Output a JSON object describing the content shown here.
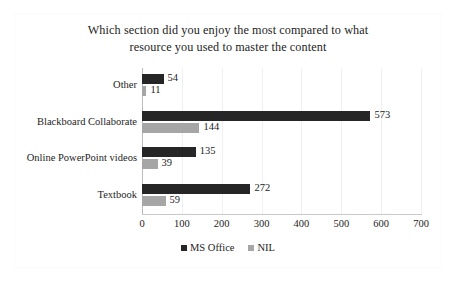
{
  "chart_data": {
    "type": "bar",
    "orientation": "horizontal",
    "title": "Which section did you enjoy the most compared to what resource you used to master the content",
    "title_lines": [
      "Which section did you enjoy the most compared to what",
      "resource you used to master the content"
    ],
    "categories": [
      "Other",
      "Blackboard Collaborate",
      "Online PowerPoint videos",
      "Textbook"
    ],
    "series": [
      {
        "name": "MS Office",
        "color": "#262626",
        "values": [
          54,
          573,
          135,
          272
        ]
      },
      {
        "name": "NIL",
        "color": "#a6a6a6",
        "values": [
          11,
          144,
          39,
          59
        ]
      }
    ],
    "xlabel": "",
    "ylabel": "",
    "xlim": [
      0,
      700
    ],
    "xticks": [
      0,
      100,
      200,
      300,
      400,
      500,
      600,
      700
    ],
    "xtick_labels": [
      "0",
      "100",
      "200",
      "300",
      "400",
      "500",
      "600",
      "700"
    ],
    "grid": true,
    "grid_axis": "x",
    "data_labels": true,
    "legend": [
      "MS Office",
      "NIL"
    ],
    "legend_position": "bottom-center"
  },
  "colors": {
    "series_ms_office": "#262626",
    "series_nil": "#a6a6a6",
    "gridline": "#eef0f2",
    "axis": "#c6cacd",
    "text": "#1d1d1d",
    "background": "#ffffff"
  }
}
